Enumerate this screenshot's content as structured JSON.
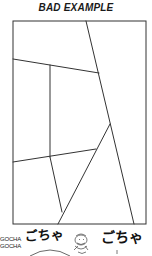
{
  "title": "BAD EXAMPLE",
  "sfx": {
    "small_line_1": "GOCHA",
    "small_line_2": "GOCHA",
    "left": "ごちゃ",
    "right": "ごちゃ"
  },
  "colors": {
    "ink": "#1a1a1a",
    "paper": "#ffffff"
  }
}
